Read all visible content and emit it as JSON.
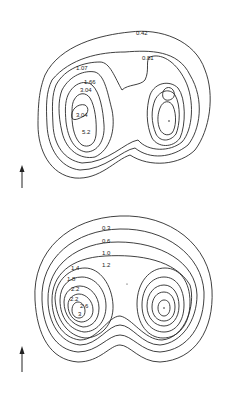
{
  "figures": [
    {
      "name": "top-contour-map",
      "labels": [
        "0.42",
        "0.81",
        "1.07",
        "1.66",
        "3.04",
        "3.04",
        "5.2"
      ],
      "arrow": "north-arrow"
    },
    {
      "name": "bottom-contour-map",
      "labels": [
        "0.3",
        "0.6",
        "1.0",
        "1.2",
        "1.4",
        "1.8",
        "2.2",
        "2.2",
        "2.6",
        "3"
      ],
      "arrow": "north-arrow"
    }
  ],
  "colors": {
    "line": "#2a2a2a",
    "background": "#ffffff"
  }
}
